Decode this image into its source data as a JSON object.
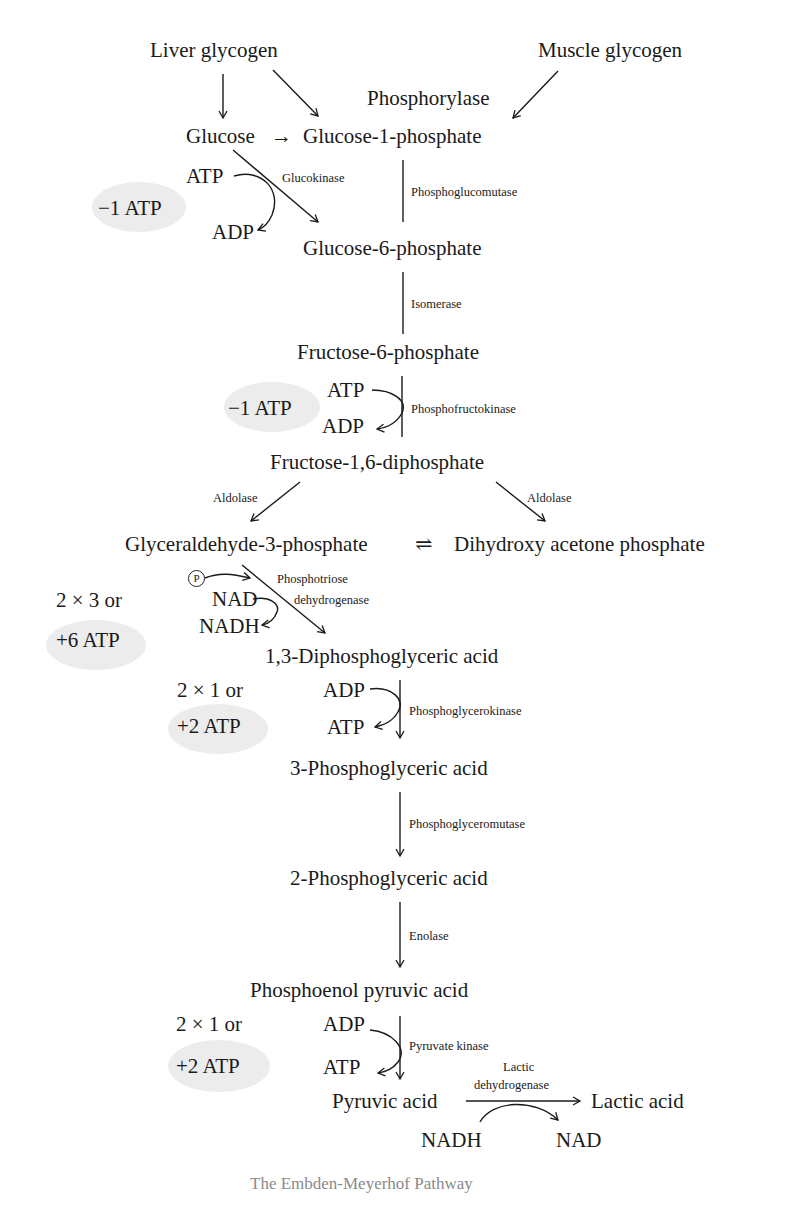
{
  "diagram": {
    "title": "The Embden-Meyerhof Pathway",
    "sources": {
      "liver_glycogen": "Liver glycogen",
      "muscle_glycogen": "Muscle glycogen",
      "phosphorylase": "Phosphorylase"
    },
    "metabolites": {
      "glucose": "Glucose",
      "glucose_arrow": "→",
      "glucose_1_phosphate": "Glucose-1-phosphate",
      "glucose_6_phosphate": "Glucose-6-phosphate",
      "fructose_6_phosphate": "Fructose-6-phosphate",
      "fructose_1_6_diphosphate": "Fructose-1,6-diphosphate",
      "glyceraldehyde_3_phosphate": "Glyceraldehyde-3-phosphate",
      "equilibrium_arrow": "⇌",
      "dihydroxy_acetone_phosphate": "Dihydroxy acetone phosphate",
      "diphosphoglyceric_acid_1_3": "1,3-Diphosphoglyceric acid",
      "phosphoglyceric_acid_3": "3-Phosphoglyceric acid",
      "phosphoglyceric_acid_2": "2-Phosphoglyceric acid",
      "phosphoenol_pyruvic_acid": "Phosphoenol pyruvic acid",
      "pyruvic_acid": "Pyruvic acid",
      "lactic_acid": "Lactic acid"
    },
    "enzymes": {
      "glucokinase": "Glucokinase",
      "phosphoglucomutase": "Phosphoglucomutase",
      "isomerase": "Isomerase",
      "phosphofructokinase": "Phosphofructokinase",
      "aldolase_left": "Aldolase",
      "aldolase_right": "Aldolase",
      "phosphotriose": "Phosphotriose",
      "dehydrogenase": "dehydrogenase",
      "phosphoglycerokinase": "Phosphoglycerokinase",
      "phosphoglyceromutase": "Phosphoglyceromutase",
      "enolase": "Enolase",
      "pyruvate_kinase": "Pyruvate kinase",
      "lactic": "Lactic",
      "lactic_dehydrogenase": "dehydrogenase"
    },
    "cofactors": {
      "glucokinase_in": "ATP",
      "glucokinase_out": "ADP",
      "pfk_in": "ATP",
      "pfk_out": "ADP",
      "phosphate_symbol": "P",
      "gapdh_in": "NAD",
      "gapdh_out": "NADH",
      "pgk_in": "ADP",
      "pgk_out": "ATP",
      "pk_in": "ADP",
      "pk_out": "ATP",
      "ldh_in": "NADH",
      "ldh_out": "NAD"
    },
    "energy_balance": {
      "glucokinase": "−1 ATP",
      "pfk": "−1 ATP",
      "gapdh_mult": "2 × 3 or",
      "gapdh": "+6 ATP",
      "pgk_mult": "2 × 1 or",
      "pgk": "+2 ATP",
      "pk_mult": "2 × 1 or",
      "pk": "+2 ATP"
    },
    "colors": {
      "ink": "#1a1a1a",
      "highlight": "#ececec",
      "caption": "#8a8a8a"
    }
  }
}
